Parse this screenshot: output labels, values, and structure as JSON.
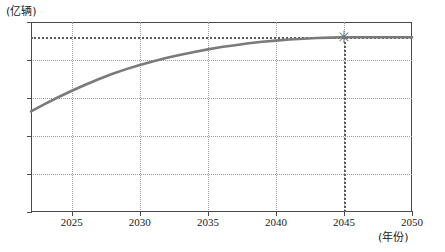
{
  "chart_data": {
    "type": "line",
    "title": "",
    "xlabel": "(年份)",
    "ylabel": "(亿辆)",
    "xlim": [
      2022,
      2050
    ],
    "ylim": [
      0,
      5
    ],
    "grid": true,
    "legend": "none",
    "x_ticks": [
      "2025",
      "2030",
      "2035",
      "2040",
      "2045",
      "2050"
    ],
    "x_tick_values": [
      2025,
      2030,
      2035,
      2040,
      2045,
      2050
    ],
    "y_ticks": [
      "0",
      "1",
      "2",
      "3",
      "4",
      "5"
    ],
    "y_tick_values": [
      0,
      1,
      2,
      3,
      4,
      5
    ],
    "series": [
      {
        "name": "汽车保有量",
        "kind": "line",
        "color": "#7a7a7a",
        "x": [
          2022,
          2023,
          2024,
          2025,
          2026,
          2027,
          2028,
          2029,
          2030,
          2031,
          2032,
          2033,
          2034,
          2035,
          2036,
          2037,
          2038,
          2039,
          2040,
          2041,
          2042,
          2043,
          2044,
          2045,
          2046,
          2047,
          2048,
          2049,
          2050
        ],
        "values": [
          2.65,
          2.84,
          3.02,
          3.19,
          3.35,
          3.5,
          3.64,
          3.76,
          3.87,
          3.97,
          4.06,
          4.14,
          4.21,
          4.28,
          4.34,
          4.39,
          4.44,
          4.48,
          4.51,
          4.54,
          4.56,
          4.58,
          4.59,
          4.6,
          4.6,
          4.6,
          4.6,
          4.6,
          4.6
        ]
      }
    ],
    "annotations": [
      {
        "name": "saturation-line",
        "kind": "hline",
        "y": 4.6,
        "style": "dotted",
        "color": "#5c5c5c"
      },
      {
        "name": "target-year-line",
        "kind": "vline",
        "x": 2045,
        "y_top": 4.6,
        "style": "dotted",
        "color": "#5c5c5c"
      },
      {
        "name": "saturation-point-marker",
        "kind": "point",
        "x": 2045,
        "y": 4.6,
        "glyph": "✳",
        "color": "#6a6a6a"
      }
    ]
  }
}
